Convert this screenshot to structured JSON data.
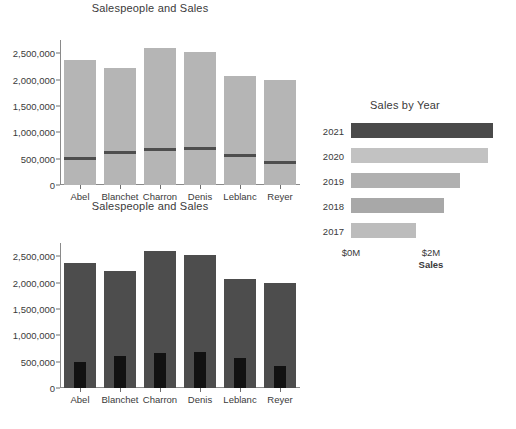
{
  "chart_data": [
    {
      "id": "salespeople-sales-top",
      "type": "bar",
      "title": "Salespeople and Sales",
      "xlabel": "",
      "ylabel": "",
      "categories": [
        "Abel",
        "Blanchet",
        "Charron",
        "Denis",
        "Leblanc",
        "Reyer"
      ],
      "ylim": [
        0,
        2750000
      ],
      "yticks": [
        0,
        500000,
        1000000,
        1500000,
        2000000,
        2500000
      ],
      "ytick_labels": [
        "0",
        "500,000",
        "1,000,000",
        "1,500,000",
        "2,000,000",
        "2,500,000"
      ],
      "grid": false,
      "legend": "none",
      "series": [
        {
          "name": "Sales",
          "mark": "bar",
          "color": "#b5b5b5",
          "values": [
            2380000,
            2220000,
            2600000,
            2530000,
            2070000,
            1990000
          ]
        },
        {
          "name": "Quota",
          "mark": "reference-line",
          "color": "#4e4e4e",
          "values": [
            500000,
            610000,
            670000,
            690000,
            560000,
            420000
          ]
        }
      ]
    },
    {
      "id": "salespeople-sales-bottom",
      "type": "bar",
      "title": "Salespeople and Sales",
      "xlabel": "",
      "ylabel": "",
      "categories": [
        "Abel",
        "Blanchet",
        "Charron",
        "Denis",
        "Leblanc",
        "Reyer"
      ],
      "ylim": [
        0,
        2750000
      ],
      "yticks": [
        0,
        500000,
        1000000,
        1500000,
        2000000,
        2500000
      ],
      "ytick_labels": [
        "0",
        "500,000",
        "1,000,000",
        "1,500,000",
        "2,000,000",
        "2,500,000"
      ],
      "grid": false,
      "legend": "none",
      "series": [
        {
          "name": "Sales",
          "mark": "bar",
          "color": "#4d4d4d",
          "values": [
            2380000,
            2220000,
            2600000,
            2530000,
            2070000,
            1990000
          ]
        },
        {
          "name": "Quota",
          "mark": "bar-overlay",
          "color": "#121212",
          "values": [
            500000,
            610000,
            670000,
            690000,
            560000,
            420000
          ]
        }
      ]
    },
    {
      "id": "sales-by-year",
      "type": "bar",
      "orientation": "horizontal",
      "title": "Sales by Year",
      "xlabel": "Sales",
      "ylabel": "",
      "categories": [
        "2021",
        "2020",
        "2019",
        "2018",
        "2017"
      ],
      "xlim": [
        0,
        4000000
      ],
      "xticks": [
        0,
        2000000
      ],
      "xtick_labels": [
        "$0M",
        "$2M"
      ],
      "grid": false,
      "legend": "none",
      "series": [
        {
          "name": "Sales",
          "values": [
            3550000,
            3430000,
            2720000,
            2320000,
            1620000
          ],
          "colors": [
            "#4a4a4a",
            "#c2c2c2",
            "#b0b0b0",
            "#a8a8a8",
            "#bcbcbc"
          ]
        }
      ]
    }
  ]
}
